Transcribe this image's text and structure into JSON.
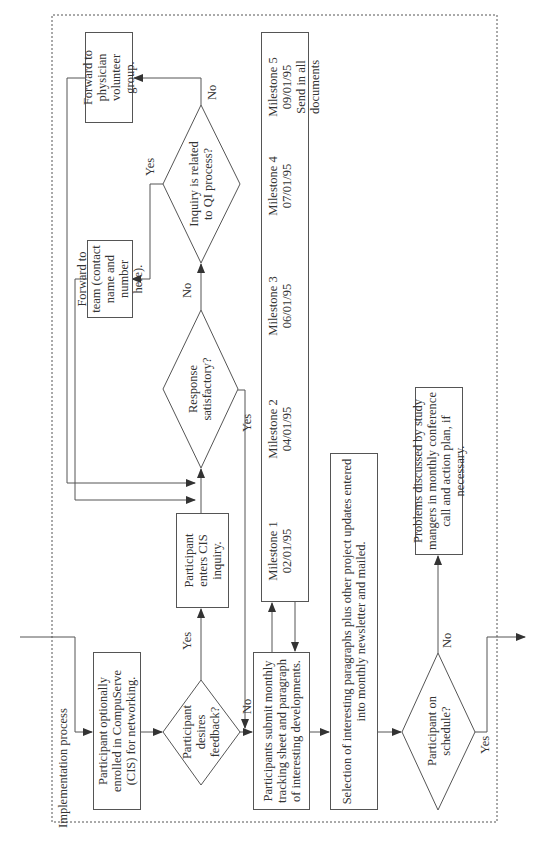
{
  "frame": {
    "title": "Implementation process"
  },
  "nodes": {
    "enroll": "Participant optionally enrolled in CompuServe (CIS) for networking.",
    "desires_feedback": "Participant desires feedback?",
    "enters_inquiry": "Participant enters CIS inquiry.",
    "response_satisfactory": "Response satisfactory?",
    "inquiry_related": "Inquiry is related to QI process?",
    "forward_team": "Forward to team (contact name and number here).",
    "forward_physician": "Forward to physician volunteer group.",
    "submit_monthly": "Participants submit monthly tracking sheet and paragraph of interesting developments.",
    "selection": "Selection of interesting paragraphs plus other project updates entered into monthly newsletter and mailed.",
    "on_schedule": "Participant on schedule?",
    "problems": "Problems discussed by study mangers in monthly conference call and action plan, if necessary."
  },
  "edge_labels": {
    "feedback_yes": "Yes",
    "feedback_no": "No",
    "response_yes": "Yes",
    "response_no": "No",
    "inquiry_yes": "Yes",
    "inquiry_no": "No",
    "schedule_no": "No",
    "schedule_yes": "Yes"
  },
  "milestones": [
    {
      "name": "Milestone 1",
      "date": "02/01/95",
      "note": ""
    },
    {
      "name": "Milestone 2",
      "date": "04/01/95",
      "note": ""
    },
    {
      "name": "Milestone 3",
      "date": "06/01/95",
      "note": ""
    },
    {
      "name": "Milestone 4",
      "date": "07/01/95",
      "note": ""
    },
    {
      "name": "Milestone 5",
      "date": "09/01/95",
      "note": "Send in all documents"
    }
  ],
  "colors": {
    "line": "#555555",
    "text": "#333333",
    "background": "#ffffff"
  }
}
